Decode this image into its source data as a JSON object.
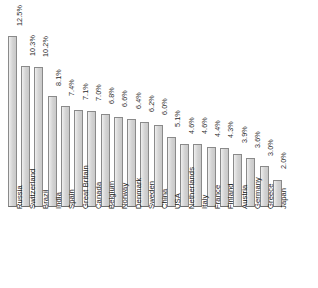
{
  "chart_data": {
    "type": "bar",
    "title": "",
    "subtitle": "",
    "xlabel": "",
    "ylabel": "",
    "grid": false,
    "legend": false,
    "legend_position": "none",
    "orientation": "vertical",
    "ylim": [
      0,
      12.5
    ],
    "value_suffix": "%",
    "categories": [
      "Russia",
      "Switzerland",
      "Brazil",
      "India",
      "Spain",
      "Great Britain",
      "Canada",
      "Belgium",
      "Norway",
      "Denmark",
      "Sweden",
      "China",
      "USA",
      "Netherlands",
      "Italy",
      "France",
      "Finland",
      "Austria",
      "Germany",
      "Greece",
      "Japan"
    ],
    "values": [
      12.5,
      10.3,
      10.2,
      8.1,
      7.4,
      7.1,
      7.0,
      6.8,
      6.6,
      6.4,
      6.2,
      6.0,
      5.1,
      4.6,
      4.6,
      4.4,
      4.3,
      3.9,
      3.6,
      3.0,
      2.0
    ],
    "value_labels": [
      "12.5%",
      "10.3%",
      "10.2%",
      "8.1%",
      "7.4%",
      "7.1%",
      "7.0%",
      "6.8%",
      "6.6%",
      "6.4%",
      "6.2%",
      "6.0%",
      "5.1%",
      "4.6%",
      "4.6%",
      "4.4%",
      "4.3%",
      "3.9%",
      "3.6%",
      "3.0%",
      "2.0%"
    ],
    "colors": {
      "bar_fill": "#d7d7d7",
      "bar_border": "#8a8a8a",
      "background": "#ffffff",
      "text": "#1a1a1a"
    }
  }
}
